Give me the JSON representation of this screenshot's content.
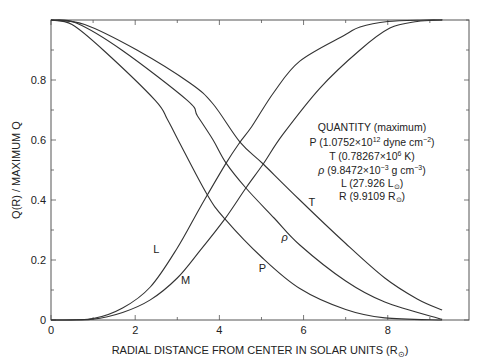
{
  "chart_data": {
    "type": "line",
    "title": "",
    "xlabel": "RADIAL DISTANCE FROM CENTER IN SOLAR UNITS (R",
    "xlabel_sub": "⊙",
    "xlabel_close": ")",
    "ylabel": "Q(R) / MAXIMUM Q",
    "xlim": [
      0,
      9.93
    ],
    "ylim": [
      0,
      1.0
    ],
    "x_ticks": [
      0,
      2,
      4,
      6,
      8
    ],
    "x_tick_labels": [
      "0",
      "2",
      "4",
      "6",
      "8"
    ],
    "x_minor_step": 1,
    "y_ticks": [
      0,
      0.2,
      0.4,
      0.6,
      0.8
    ],
    "y_tick_labels": [
      "0",
      "0.2",
      "0.4",
      "0.6",
      "0.8"
    ],
    "y_minor_step": 0.1,
    "grid": false,
    "series": [
      {
        "name": "P",
        "label_pos": [
          5.02,
          0.16
        ],
        "italic": false,
        "points": [
          [
            0,
            1
          ],
          [
            0.5,
            0.985
          ],
          [
            1.24,
            0.9
          ],
          [
            2.47,
            0.733
          ],
          [
            2.76,
            0.67
          ],
          [
            3.02,
            0.6
          ],
          [
            3.7,
            0.42
          ],
          [
            4.13,
            0.337
          ],
          [
            5.0,
            0.21
          ],
          [
            5.91,
            0.105
          ],
          [
            7.0,
            0.035
          ],
          [
            7.93,
            0.007
          ],
          [
            9.29,
            0
          ]
        ]
      },
      {
        "name": "ρ",
        "label_pos": [
          5.55,
          0.265
        ],
        "italic": true,
        "points": [
          [
            0,
            1
          ],
          [
            0.6,
            0.99
          ],
          [
            1.68,
            0.9
          ],
          [
            3.23,
            0.733
          ],
          [
            3.48,
            0.68
          ],
          [
            3.85,
            0.6
          ],
          [
            4.16,
            0.523
          ],
          [
            4.63,
            0.44
          ],
          [
            5.3,
            0.34
          ],
          [
            5.91,
            0.25
          ],
          [
            7.0,
            0.13
          ],
          [
            7.93,
            0.06
          ],
          [
            9.29,
            0.002
          ]
        ]
      },
      {
        "name": "T",
        "label_pos": [
          6.2,
          0.38
        ],
        "italic": false,
        "points": [
          [
            0,
            1
          ],
          [
            0.8,
            0.985
          ],
          [
            2.04,
            0.9
          ],
          [
            3.3,
            0.79
          ],
          [
            3.85,
            0.72
          ],
          [
            4.49,
            0.593
          ],
          [
            5.04,
            0.52
          ],
          [
            5.91,
            0.4
          ],
          [
            7.0,
            0.255
          ],
          [
            7.93,
            0.14
          ],
          [
            8.7,
            0.07
          ],
          [
            9.29,
            0.033
          ]
        ]
      },
      {
        "name": "L",
        "label_pos": [
          2.5,
          0.225
        ],
        "italic": false,
        "points": [
          [
            0,
            0
          ],
          [
            1,
            0.005
          ],
          [
            1.7,
            0.04
          ],
          [
            2.36,
            0.11
          ],
          [
            3.0,
            0.24
          ],
          [
            3.55,
            0.377
          ],
          [
            4.16,
            0.523
          ],
          [
            4.49,
            0.593
          ],
          [
            4.77,
            0.645
          ],
          [
            5.3,
            0.76
          ],
          [
            5.91,
            0.863
          ],
          [
            6.98,
            0.95
          ],
          [
            7.34,
            0.977
          ],
          [
            8.0,
            0.995
          ],
          [
            8.9,
            1
          ],
          [
            9.29,
            1
          ]
        ]
      },
      {
        "name": "M",
        "label_pos": [
          3.2,
          0.12
        ],
        "italic": false,
        "points": [
          [
            0,
            0
          ],
          [
            1,
            0.003
          ],
          [
            1.7,
            0.025
          ],
          [
            2.36,
            0.067
          ],
          [
            3.0,
            0.14
          ],
          [
            3.55,
            0.233
          ],
          [
            4.13,
            0.337
          ],
          [
            4.63,
            0.44
          ],
          [
            5.04,
            0.52
          ],
          [
            5.5,
            0.617
          ],
          [
            6.39,
            0.773
          ],
          [
            7.34,
            0.9
          ],
          [
            8.05,
            0.973
          ],
          [
            8.7,
            0.995
          ],
          [
            9.24,
            1
          ],
          [
            9.29,
            1
          ]
        ]
      }
    ],
    "annotations": {
      "legend_title": "QUANTITY (maximum)",
      "lines": [
        {
          "pre": "P (1.0752",
          "times": "×",
          "base": "10",
          "sup": "12",
          "post": " dyne cm",
          "post_sup": "−2",
          "end": ")"
        },
        {
          "pre": "T (0.78267",
          "times": "×",
          "base": "10",
          "sup": "6",
          "post": " K)",
          "post_sup": "",
          "end": ""
        },
        {
          "pre_italic": "ρ",
          "pre": " (9.8472",
          "times": "×",
          "base": "10",
          "sup": "−3",
          "post": " g  cm",
          "post_sup": "−3",
          "end": ")"
        },
        {
          "pre": "L (27.926 L",
          "sub": "⊙",
          "end": ")"
        },
        {
          "pre": "R (9.9109 R",
          "sub": "⊙",
          "end": ")"
        }
      ]
    }
  }
}
